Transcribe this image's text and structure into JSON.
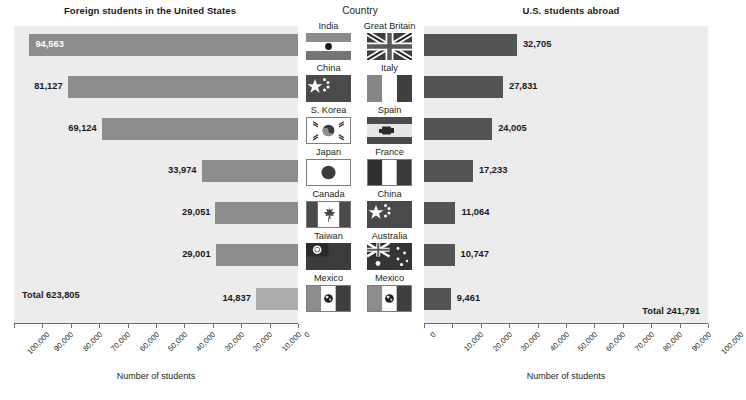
{
  "titles": {
    "left_panel": "Foreign students in the United States",
    "center_panel": "Country",
    "right_panel": "U.S. students abroad"
  },
  "axis": {
    "caption": "Number of students",
    "left_ticklabels": [
      "100,000",
      "90,000",
      "80,000",
      "70,000",
      "60,000",
      "50,000",
      "40,000",
      "30,000",
      "20,000",
      "10,000",
      "0"
    ],
    "right_ticklabels": [
      "0",
      "10,000",
      "20,000",
      "30,000",
      "40,000",
      "50,000",
      "60,000",
      "70,000",
      "80,000",
      "90,000",
      "100,000"
    ]
  },
  "totals": {
    "left": "Total 623,805",
    "right": "Total 241,791"
  },
  "colors": {
    "plot_background": "#ececec",
    "bar_left": "#8d8d8d",
    "bar_left_muted": "#acacac",
    "bar_right": "#545454",
    "axis": "#6d6d6d",
    "text": "#231f20"
  },
  "countries_left": [
    "India",
    "China",
    "S. Korea",
    "Japan",
    "Canada",
    "Taiwan",
    "Mexico"
  ],
  "countries_right": [
    "Great Britain",
    "Italy",
    "Spain",
    "France",
    "China",
    "Australia",
    "Mexico"
  ],
  "flags_left": [
    "india-flag-icon",
    "china-flag-icon",
    "south-korea-flag-icon",
    "japan-flag-icon",
    "canada-flag-icon",
    "taiwan-flag-icon",
    "mexico-flag-icon"
  ],
  "flags_right": [
    "great-britain-flag-icon",
    "italy-flag-icon",
    "spain-flag-icon",
    "france-flag-icon",
    "china-flag-icon",
    "australia-flag-icon",
    "mexico-flag-icon"
  ],
  "chart_data": {
    "type": "bar",
    "xlabel": "Number of students",
    "ylabel": "Country",
    "orientation": "horizontal",
    "layout": "back-to-back / butterfly with central country column",
    "grid": false,
    "legend": "none",
    "panels": [
      {
        "name": "left",
        "title": "Foreign students in the United States",
        "direction": "right-to-left",
        "xlim": [
          0,
          100000
        ],
        "axis_reversed": true,
        "total": 623805,
        "total_label": "Total 623,805",
        "categories": [
          "India",
          "China",
          "S. Korea",
          "Japan",
          "Canada",
          "Taiwan",
          "Mexico"
        ],
        "values": [
          94563,
          81127,
          69124,
          33974,
          29051,
          29001,
          14837
        ],
        "value_labels": [
          "94,563",
          "81,127",
          "69,124",
          "33,974",
          "29,051",
          "29,001",
          "14,837"
        ]
      },
      {
        "name": "right",
        "title": "U.S. students abroad",
        "direction": "left-to-right",
        "xlim": [
          0,
          100000
        ],
        "axis_reversed": false,
        "total": 241791,
        "total_label": "Total 241,791",
        "categories": [
          "Great Britain",
          "Italy",
          "Spain",
          "France",
          "China",
          "Australia",
          "Mexico"
        ],
        "values": [
          32705,
          27831,
          24005,
          17233,
          11064,
          10747,
          9461
        ],
        "value_labels": [
          "32,705",
          "27,831",
          "24,005",
          "17,233",
          "11,064",
          "10,747",
          "9,461"
        ]
      }
    ]
  }
}
